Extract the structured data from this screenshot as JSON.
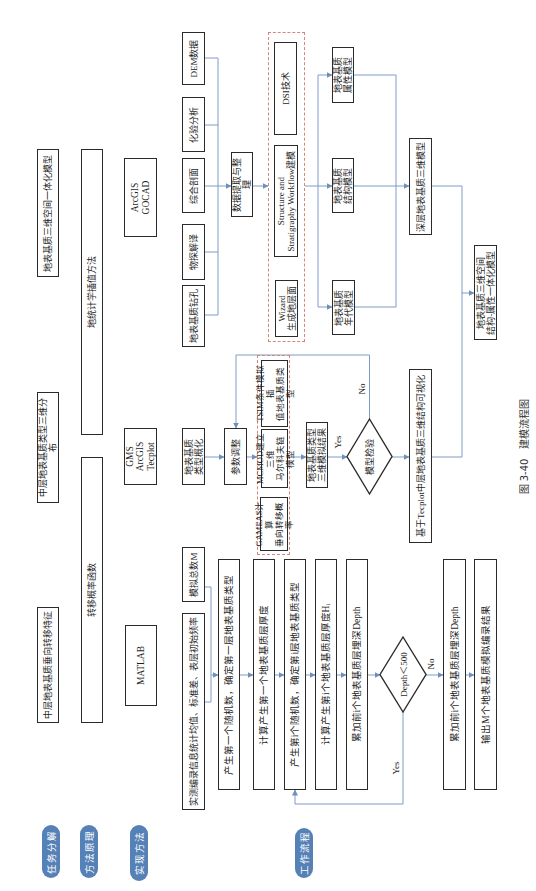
{
  "caption": {
    "figure_no": "图 3-40",
    "title": "建模流程图"
  },
  "row_labels": [
    "任务分解",
    "方法原理",
    "实现方法",
    "工作流程"
  ],
  "tasks": [
    "中层地表基质垂向转移特征",
    "中层地表基质类型三维分布",
    "地表基质三维空间一体化模型"
  ],
  "methods": [
    "转移概率函数",
    "地统计学插值方法"
  ],
  "tools": [
    "MATLAB",
    "GMS\nArcGIS\nTecplot",
    "ArcGIS\nGOCAD"
  ],
  "markov_flow": {
    "inputs": [
      "实测编录信息统计均值、标准差、表层初始频率",
      "模拟总数M"
    ],
    "steps": [
      "产生第一个随机数，确定第一层地表基质类型",
      "计算产生第一个地表基质层厚度",
      "产生第i个随机数，确定第i层地表基质类型",
      "计算产生第i个地表基质层厚度Hᵢ",
      "累加前i个地表基质层埋深Depth"
    ],
    "decision": "Depth＜500",
    "yes_label": "Yes",
    "no_label": "No",
    "after": [
      "累加前i个地表基质层埋深Depth",
      "输出M个地表基质模拟编录结果"
    ]
  },
  "tprogs_flow": {
    "input": "地表基质\n类型概化",
    "adjust": "参数调整",
    "group": [
      "GAMEAS计算\n垂向转移概率",
      "MCMOD建立三维\n马尔科夫链模型",
      "TSIM条件模拟插\n值地表基质类型"
    ],
    "result": "地表基质类型\n三维模拟结果",
    "check": "模型检验",
    "yes_label": "Yes",
    "no_label": "No",
    "visualize": "基于Tecplot中层地表基质三维结构可视化"
  },
  "gocad_flow": {
    "sources": [
      "地表基质钻孔",
      "物探解译",
      "综合剖面",
      "化验分析",
      "DEM数据"
    ],
    "extract": "数据提取与整理",
    "group": [
      "Wizard\n生成地层面",
      "Structure and\nStratigraphy Workflow建模",
      "DSI技术"
    ],
    "models": [
      "地表基质\n年代模型",
      "地表基质\n结构模型",
      "地表基质\n属性模型"
    ],
    "deep_model": "深层地表基质三维模型",
    "integrated": "地表基质三维空间\n结构-属性一体化模型"
  },
  "colors": {
    "pill": "#5681b6",
    "connector": "#7e9cc4",
    "dashed_group": "#d8857a",
    "box_border": "#2b2b2b",
    "top_rule": "#8fb09b"
  }
}
